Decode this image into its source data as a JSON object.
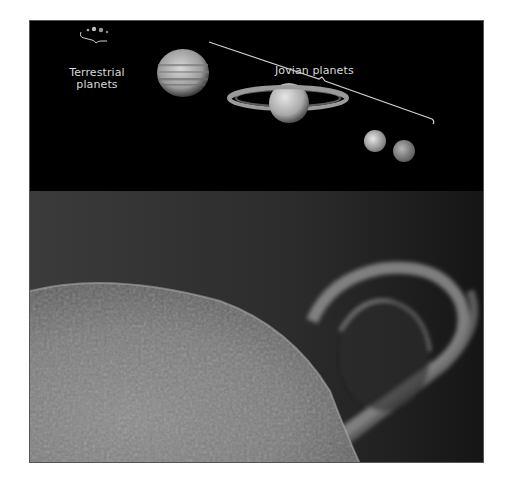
{
  "figure": {
    "top_panel": {
      "description": "Solar system planets to scale",
      "labels": {
        "terrestrial": "Terrestrial planets",
        "terrestrial_line1": "Terrestrial",
        "terrestrial_line2": "planets",
        "jovian": "Jovian planets"
      },
      "planets": [
        {
          "name": "jupiter",
          "type": "jovian"
        },
        {
          "name": "saturn",
          "type": "jovian"
        },
        {
          "name": "uranus",
          "type": "jovian"
        },
        {
          "name": "neptune",
          "type": "jovian"
        },
        {
          "name": "terrestrial-group",
          "type": "terrestrial"
        }
      ]
    },
    "bottom_panel": {
      "description": "Sun limb with large solar prominence loop"
    },
    "colors": {
      "background": "#000000",
      "label_text": "#d8d8d8",
      "page": "#ffffff"
    }
  }
}
